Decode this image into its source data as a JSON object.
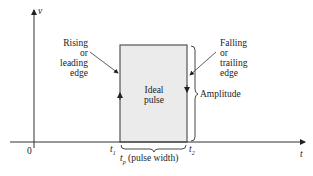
{
  "diagram": {
    "title": "Ideal pulse",
    "axes": {
      "y_label": "v",
      "x_label": "t",
      "origin_label": "0"
    },
    "pulse": {
      "label_line1": "Ideal",
      "label_line2": "pulse",
      "fill": "#ebebeb",
      "stroke": "#555555"
    },
    "rising_edge": {
      "line1": "Rising",
      "line2": "or",
      "line3": "leading",
      "line4": "edge"
    },
    "falling_edge": {
      "line1": "Falling",
      "line2": "or",
      "line3": "trailing",
      "line4": "edge"
    },
    "amplitude_label": "Amplitude",
    "t1_label": "t",
    "t1_sub": "1",
    "t2_label": "t",
    "t2_sub": "2",
    "pulse_width": {
      "symbol": "t",
      "sub": "p",
      "text": "(pulse width)"
    }
  }
}
